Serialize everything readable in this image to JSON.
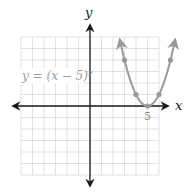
{
  "chart_data": {
    "type": "line",
    "title": "",
    "equation_label": "y = (x − 5)²",
    "xlabel": "x",
    "ylabel": "y",
    "x_tick_labels": [
      {
        "x": 5,
        "label": "5"
      }
    ],
    "xlim": [
      -6,
      6
    ],
    "ylim": [
      -6,
      6
    ],
    "grid": true,
    "grid_step": 1,
    "series": [
      {
        "name": "y = (x − 5)²",
        "function": "(x-5)^2",
        "plotted_points": [
          [
            3,
            4
          ],
          [
            4,
            1
          ],
          [
            5,
            0
          ],
          [
            6,
            1
          ],
          [
            7,
            4
          ]
        ],
        "x": [
          2.6,
          3,
          4,
          5,
          6,
          7,
          7.4
        ],
        "y": [
          5.76,
          4,
          1,
          0,
          1,
          4,
          5.76
        ],
        "color": "#999999",
        "arrows_at_ends": true
      }
    ]
  },
  "labels": {
    "x_axis": "x",
    "y_axis": "y",
    "tick_5": "5",
    "equation": "y = (x − 5)²"
  },
  "colors": {
    "grid": "#d9d9d9",
    "axes": "#1a1a1a",
    "curve": "#999999"
  }
}
